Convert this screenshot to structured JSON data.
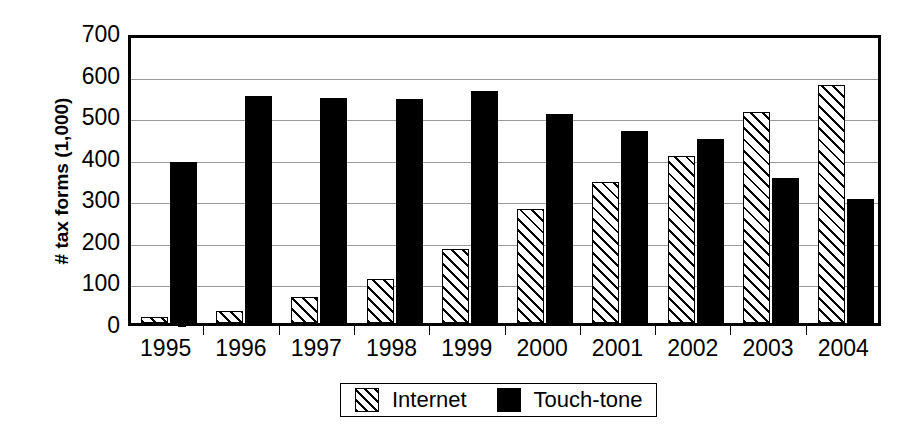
{
  "chart_data": {
    "type": "bar",
    "title": "",
    "xlabel": "",
    "ylabel": "# tax forms (1,000)",
    "categories": [
      "1995",
      "1996",
      "1997",
      "1998",
      "1999",
      "2000",
      "2001",
      "2002",
      "2003",
      "2004"
    ],
    "series": [
      {
        "name": "Internet",
        "pattern": "diagonal-hatch",
        "color": "#000000",
        "values": [
          15,
          28,
          62,
          105,
          178,
          275,
          340,
          402,
          507,
          572
        ]
      },
      {
        "name": "Touch-tone",
        "pattern": "solid",
        "color": "#000000",
        "values": [
          388,
          546,
          542,
          540,
          557,
          503,
          462,
          443,
          350,
          298
        ]
      }
    ],
    "ylim": [
      0,
      700
    ],
    "ytick_values": [
      0,
      100,
      200,
      300,
      400,
      500,
      600,
      700
    ],
    "ytick_labels": [
      "0",
      "100",
      "200",
      "300",
      "400",
      "500",
      "600",
      "700"
    ],
    "grid": "horizontal",
    "legend_position": "bottom-center",
    "legend_entries": [
      "Internet",
      "Touch-tone"
    ]
  },
  "legend": {
    "internet_label": "Internet",
    "touchtone_label": "Touch-tone"
  }
}
